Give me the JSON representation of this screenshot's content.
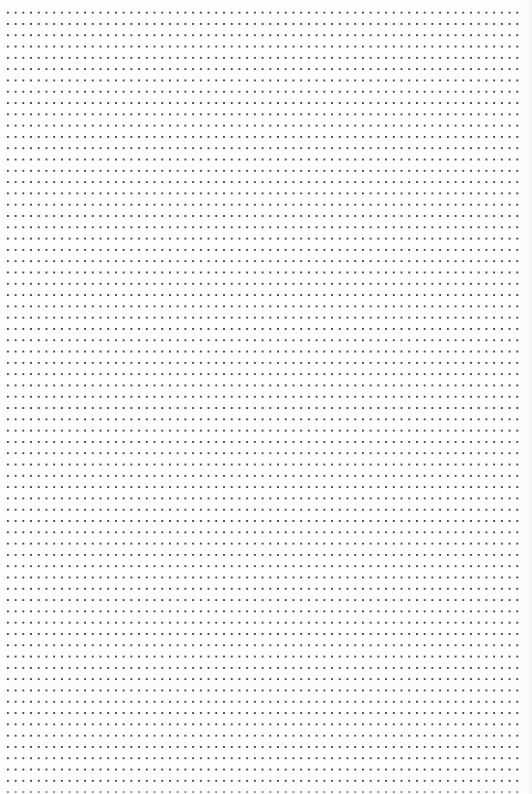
{
  "page": {
    "type": "dot-grid paper",
    "background_color": "#fdfdfd",
    "dot_color": "#4a4a4a",
    "grid": {
      "columns": 67,
      "rows": 70,
      "horizontal_spacing_px": 7.72,
      "vertical_spacing_px": 11.3,
      "first_dot_x": 8,
      "first_dot_y": 13
    }
  }
}
